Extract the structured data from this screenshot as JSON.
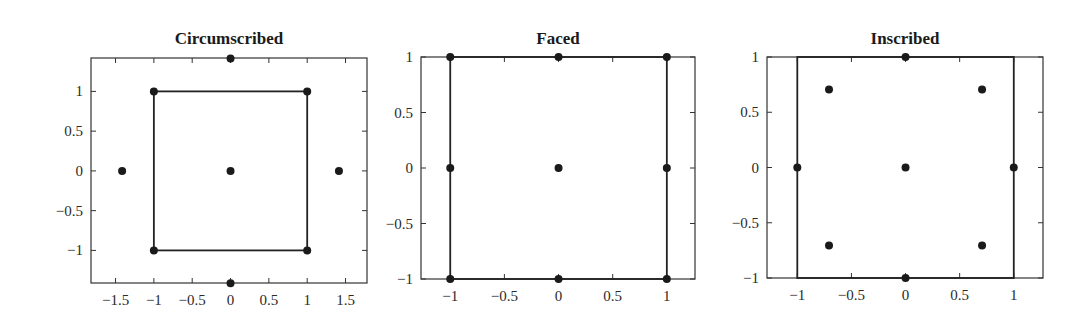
{
  "chart_data": [
    {
      "type": "scatter",
      "title": "Circumscribed",
      "xlabel": "",
      "ylabel": "",
      "xlim": [
        -1.82,
        1.78
      ],
      "ylim": [
        -1.41,
        1.42
      ],
      "xticks": [
        -1.5,
        -1,
        -0.5,
        0,
        0.5,
        1,
        1.5
      ],
      "xtick_labels": [
        "−1.5",
        "−1",
        "−0.5",
        "0",
        "0.5",
        "1",
        "1.5"
      ],
      "yticks": [
        -1,
        -0.5,
        0,
        0.5,
        1
      ],
      "ytick_labels": [
        "−1",
        "−0.5",
        "0",
        "0.5",
        "1"
      ],
      "grid": false,
      "square": [
        -1,
        1,
        -1,
        1
      ],
      "points": [
        {
          "x": -1,
          "y": -1
        },
        {
          "x": 1,
          "y": -1
        },
        {
          "x": -1,
          "y": 1
        },
        {
          "x": 1,
          "y": 1
        },
        {
          "x": -1.414,
          "y": 0
        },
        {
          "x": 1.414,
          "y": 0
        },
        {
          "x": 0,
          "y": -1.414
        },
        {
          "x": 0,
          "y": 1.414
        },
        {
          "x": 0,
          "y": 0
        }
      ],
      "frame_px": {
        "left": 91,
        "top": 58,
        "right": 367,
        "bottom": 283
      }
    },
    {
      "type": "scatter",
      "title": "Faced",
      "xlabel": "",
      "ylabel": "",
      "xlim": [
        -1.27,
        1.26
      ],
      "ylim": [
        -1,
        1
      ],
      "xticks": [
        -1,
        -0.5,
        0,
        0.5,
        1
      ],
      "xtick_labels": [
        "−1",
        "−0.5",
        "0",
        "0.5",
        "1"
      ],
      "yticks": [
        -1,
        -0.5,
        0,
        0.5,
        1
      ],
      "ytick_labels": [
        "−1",
        "−0.5",
        "0",
        "0.5",
        "1"
      ],
      "grid": false,
      "square": [
        -1,
        1,
        -1,
        1
      ],
      "points": [
        {
          "x": -1,
          "y": -1
        },
        {
          "x": 1,
          "y": -1
        },
        {
          "x": -1,
          "y": 1
        },
        {
          "x": 1,
          "y": 1
        },
        {
          "x": -1,
          "y": 0
        },
        {
          "x": 1,
          "y": 0
        },
        {
          "x": 0,
          "y": -1
        },
        {
          "x": 0,
          "y": 1
        },
        {
          "x": 0,
          "y": 0
        }
      ],
      "frame_px": {
        "left": 421,
        "top": 57,
        "right": 695,
        "bottom": 279
      }
    },
    {
      "type": "scatter",
      "title": "Inscribed",
      "xlabel": "",
      "ylabel": "",
      "xlim": [
        -1.28,
        1.27
      ],
      "ylim": [
        -1,
        1
      ],
      "xticks": [
        -1,
        -0.5,
        0,
        0.5,
        1
      ],
      "xtick_labels": [
        "−1",
        "−0.5",
        "0",
        "0.5",
        "1"
      ],
      "yticks": [
        -1,
        -0.5,
        0,
        0.5,
        1
      ],
      "ytick_labels": [
        "−1",
        "−0.5",
        "0",
        "0.5",
        "1"
      ],
      "grid": false,
      "square": [
        -1,
        1,
        -1,
        1
      ],
      "points": [
        {
          "x": -0.707,
          "y": -0.707
        },
        {
          "x": 0.707,
          "y": -0.707
        },
        {
          "x": -0.707,
          "y": 0.707
        },
        {
          "x": 0.707,
          "y": 0.707
        },
        {
          "x": -1,
          "y": 0
        },
        {
          "x": 1,
          "y": 0
        },
        {
          "x": 0,
          "y": -1
        },
        {
          "x": 0,
          "y": 1
        },
        {
          "x": 0,
          "y": 0
        }
      ],
      "frame_px": {
        "left": 767,
        "top": 57,
        "right": 1043,
        "bottom": 278
      }
    }
  ],
  "style": {
    "ink": "#1a1a1a",
    "background": "#ffffff"
  }
}
